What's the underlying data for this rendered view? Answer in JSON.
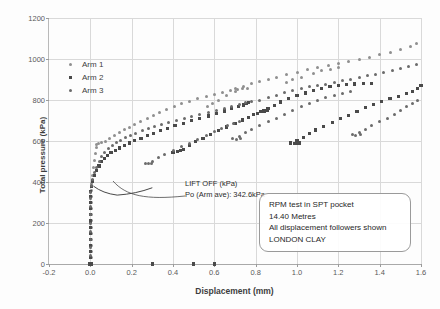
{
  "chart_data": {
    "type": "scatter",
    "title": "",
    "xlabel": "Displacement (mm)",
    "ylabel": "Total pressure (kPa)",
    "xlim": [
      -0.2,
      1.6
    ],
    "ylim": [
      0,
      1200
    ],
    "xticks": [
      "-0.2",
      "0.0",
      "0.2",
      "0.4",
      "0.6",
      "0.8",
      "1.0",
      "1.2",
      "1.4",
      "1.6"
    ],
    "yticks": [
      "0",
      "200",
      "400",
      "600",
      "800",
      "1000",
      "1200"
    ],
    "grid": true,
    "legend_position": "upper-left-inside",
    "legend": [
      "Arm 1",
      "Arm 2",
      "Arm 3"
    ],
    "colors": {
      "arm1": "#8f8f8f",
      "arm2": "#4a4a4a",
      "arm3": "#6b6b6b",
      "grid": "#d9d9d9",
      "axis": "#a9a9a9"
    },
    "annotations": [
      "LIFT OFF (kPa)",
      "Po (Arm ave): 342.6kPa",
      "RPM test in SPT pocket",
      "14.40 Metres",
      "All displacement followers shown",
      "LONDON CLAY"
    ],
    "series": [
      {
        "name": "Arm 1",
        "marker": "circle",
        "color": "#8f8f8f",
        "points": [
          [
            0.005,
            0
          ],
          [
            0.005,
            30
          ],
          [
            0.005,
            60
          ],
          [
            0.005,
            90
          ],
          [
            0.005,
            120
          ],
          [
            0.005,
            150
          ],
          [
            0.005,
            180
          ],
          [
            0.005,
            210
          ],
          [
            0.005,
            240
          ],
          [
            0.005,
            270
          ],
          [
            0.005,
            300
          ],
          [
            0.005,
            330
          ],
          [
            0.006,
            360
          ],
          [
            0.008,
            395
          ],
          [
            0.012,
            430
          ],
          [
            0.016,
            470
          ],
          [
            0.02,
            505
          ],
          [
            0.024,
            540
          ],
          [
            0.028,
            570
          ],
          [
            0.032,
            585
          ],
          [
            0.04,
            590
          ],
          [
            0.055,
            592
          ],
          [
            0.075,
            600
          ],
          [
            0.095,
            612
          ],
          [
            0.115,
            625
          ],
          [
            0.14,
            640
          ],
          [
            0.165,
            655
          ],
          [
            0.19,
            668
          ],
          [
            0.215,
            682
          ],
          [
            0.245,
            697
          ],
          [
            0.275,
            712
          ],
          [
            0.305,
            725
          ],
          [
            0.335,
            740
          ],
          [
            0.37,
            755
          ],
          [
            0.405,
            770
          ],
          [
            0.44,
            782
          ],
          [
            0.48,
            795
          ],
          [
            0.52,
            806
          ],
          [
            0.56,
            818
          ],
          [
            0.6,
            828
          ],
          [
            0.64,
            838
          ],
          [
            0.68,
            846
          ],
          [
            0.71,
            852
          ],
          [
            0.735,
            856
          ],
          [
            0.76,
            858
          ],
          [
            0.7,
            840
          ],
          [
            0.66,
            820
          ],
          [
            0.62,
            800
          ],
          [
            0.59,
            782
          ],
          [
            0.565,
            768
          ],
          [
            0.7,
            856
          ],
          [
            0.74,
            868
          ],
          [
            0.78,
            880
          ],
          [
            0.82,
            890
          ],
          [
            0.86,
            900
          ],
          [
            0.9,
            912
          ],
          [
            0.95,
            924
          ],
          [
            1.0,
            936
          ],
          [
            1.05,
            948
          ],
          [
            1.1,
            958
          ],
          [
            1.15,
            968
          ],
          [
            1.2,
            978
          ],
          [
            1.25,
            988
          ],
          [
            1.3,
            998
          ],
          [
            1.35,
            1008
          ],
          [
            1.4,
            1020
          ],
          [
            1.45,
            1032
          ],
          [
            1.5,
            1046
          ],
          [
            1.55,
            1062
          ],
          [
            1.58,
            1078
          ],
          [
            1.08,
            930
          ],
          [
            1.12,
            942
          ],
          [
            1.16,
            950
          ],
          [
            1.2,
            958
          ],
          [
            1.02,
            912
          ],
          [
            0.98,
            898
          ],
          [
            0.95,
            886
          ]
        ]
      },
      {
        "name": "Arm 2",
        "marker": "square",
        "color": "#4a4a4a",
        "points": [
          [
            0.0,
            0
          ],
          [
            0.0,
            30
          ],
          [
            0.0,
            60
          ],
          [
            0.0,
            90
          ],
          [
            0.0,
            120
          ],
          [
            0.0,
            150
          ],
          [
            0.0,
            180
          ],
          [
            0.0,
            210
          ],
          [
            0.0,
            240
          ],
          [
            0.0,
            270
          ],
          [
            0.0,
            300
          ],
          [
            0.0,
            330
          ],
          [
            0.002,
            355
          ],
          [
            0.006,
            380
          ],
          [
            0.012,
            405
          ],
          [
            0.02,
            430
          ],
          [
            0.03,
            455
          ],
          [
            0.042,
            478
          ],
          [
            0.055,
            498
          ],
          [
            0.07,
            516
          ],
          [
            0.085,
            530
          ],
          [
            0.1,
            542
          ],
          [
            0.12,
            554
          ],
          [
            0.14,
            566
          ],
          [
            0.165,
            578
          ],
          [
            0.19,
            590
          ],
          [
            0.215,
            602
          ],
          [
            0.245,
            614
          ],
          [
            0.275,
            626
          ],
          [
            0.305,
            638
          ],
          [
            0.34,
            650
          ],
          [
            0.375,
            662
          ],
          [
            0.41,
            674
          ],
          [
            0.45,
            686
          ],
          [
            0.49,
            698
          ],
          [
            0.53,
            710
          ],
          [
            0.57,
            722
          ],
          [
            0.61,
            734
          ],
          [
            0.65,
            746
          ],
          [
            0.685,
            758
          ],
          [
            0.715,
            768
          ],
          [
            0.74,
            776
          ],
          [
            0.755,
            782
          ],
          [
            0.765,
            786
          ],
          [
            0.45,
            560
          ],
          [
            0.48,
            578
          ],
          [
            0.51,
            596
          ],
          [
            0.545,
            614
          ],
          [
            0.58,
            632
          ],
          [
            0.62,
            650
          ],
          [
            0.66,
            668
          ],
          [
            0.7,
            686
          ],
          [
            0.735,
            702
          ],
          [
            0.765,
            716
          ],
          [
            0.79,
            728
          ],
          [
            0.81,
            736
          ],
          [
            0.825,
            742
          ],
          [
            0.84,
            746
          ],
          [
            0.855,
            748
          ],
          [
            0.4,
            545
          ],
          [
            0.42,
            548
          ],
          [
            0.435,
            552
          ],
          [
            0.86,
            760
          ],
          [
            0.89,
            775
          ],
          [
            0.92,
            790
          ],
          [
            0.96,
            806
          ],
          [
            1.0,
            820
          ],
          [
            1.04,
            834
          ],
          [
            1.08,
            846
          ],
          [
            1.12,
            856
          ],
          [
            1.16,
            864
          ],
          [
            1.2,
            870
          ],
          [
            1.24,
            874
          ],
          [
            1.28,
            878
          ],
          [
            1.32,
            880
          ],
          [
            1.36,
            882
          ],
          [
            1.0,
            600
          ],
          [
            1.03,
            618
          ],
          [
            1.06,
            636
          ],
          [
            1.09,
            654
          ],
          [
            1.13,
            672
          ],
          [
            1.17,
            690
          ],
          [
            1.21,
            708
          ],
          [
            1.25,
            726
          ],
          [
            1.29,
            744
          ],
          [
            1.33,
            762
          ],
          [
            1.37,
            778
          ],
          [
            1.41,
            792
          ],
          [
            1.45,
            806
          ],
          [
            1.49,
            818
          ],
          [
            1.53,
            830
          ],
          [
            1.56,
            842
          ],
          [
            1.585,
            855
          ],
          [
            1.6,
            870
          ],
          [
            0.97,
            590
          ],
          [
            0.99,
            588
          ],
          [
            1.01,
            590
          ]
        ]
      },
      {
        "name": "Arm 3",
        "marker": "circle",
        "color": "#6b6b6b",
        "points": [
          [
            0.0,
            0
          ],
          [
            0.0,
            40
          ],
          [
            0.0,
            80
          ],
          [
            0.0,
            120
          ],
          [
            0.0,
            160
          ],
          [
            0.0,
            200
          ],
          [
            0.0,
            240
          ],
          [
            0.0,
            280
          ],
          [
            0.0,
            320
          ],
          [
            0.002,
            350
          ],
          [
            0.006,
            382
          ],
          [
            0.012,
            412
          ],
          [
            0.02,
            444
          ],
          [
            0.03,
            472
          ],
          [
            0.042,
            498
          ],
          [
            0.056,
            522
          ],
          [
            0.07,
            544
          ],
          [
            0.088,
            562
          ],
          [
            0.106,
            578
          ],
          [
            0.126,
            592
          ],
          [
            0.148,
            604
          ],
          [
            0.17,
            616
          ],
          [
            0.195,
            628
          ],
          [
            0.22,
            638
          ],
          [
            0.25,
            650
          ],
          [
            0.28,
            660
          ],
          [
            0.31,
            670
          ],
          [
            0.345,
            680
          ],
          [
            0.38,
            690
          ],
          [
            0.415,
            700
          ],
          [
            0.455,
            710
          ],
          [
            0.49,
            720
          ],
          [
            0.53,
            730
          ],
          [
            0.57,
            740
          ],
          [
            0.61,
            750
          ],
          [
            0.65,
            760
          ],
          [
            0.685,
            770
          ],
          [
            0.72,
            778
          ],
          [
            0.75,
            786
          ],
          [
            0.78,
            792
          ],
          [
            0.82,
            800
          ],
          [
            0.86,
            812
          ],
          [
            0.9,
            824
          ],
          [
            0.94,
            836
          ],
          [
            0.98,
            846
          ],
          [
            1.02,
            856
          ],
          [
            1.06,
            864
          ],
          [
            1.1,
            872
          ],
          [
            1.14,
            878
          ],
          [
            1.18,
            886
          ],
          [
            1.22,
            894
          ],
          [
            1.26,
            902
          ],
          [
            1.3,
            910
          ],
          [
            1.34,
            918
          ],
          [
            1.38,
            926
          ],
          [
            1.42,
            934
          ],
          [
            1.46,
            942
          ],
          [
            1.5,
            952
          ],
          [
            1.54,
            962
          ],
          [
            1.58,
            974
          ],
          [
            1.3,
            640
          ],
          [
            1.33,
            658
          ],
          [
            1.36,
            676
          ],
          [
            1.4,
            694
          ],
          [
            1.44,
            712
          ],
          [
            1.47,
            730
          ],
          [
            1.5,
            748
          ],
          [
            1.53,
            766
          ],
          [
            1.56,
            784
          ],
          [
            1.585,
            800
          ],
          [
            1.27,
            632
          ],
          [
            1.285,
            628
          ],
          [
            1.305,
            630
          ],
          [
            0.72,
            622
          ],
          [
            0.75,
            640
          ],
          [
            0.78,
            658
          ],
          [
            0.82,
            676
          ],
          [
            0.86,
            694
          ],
          [
            0.9,
            712
          ],
          [
            0.94,
            730
          ],
          [
            0.98,
            748
          ],
          [
            1.02,
            766
          ],
          [
            1.06,
            782
          ],
          [
            1.1,
            796
          ],
          [
            1.14,
            810
          ],
          [
            1.18,
            822
          ],
          [
            1.22,
            832
          ],
          [
            1.26,
            840
          ],
          [
            0.69,
            612
          ],
          [
            0.705,
            608
          ],
          [
            0.725,
            612
          ],
          [
            0.3,
            500
          ],
          [
            0.33,
            518
          ],
          [
            0.36,
            536
          ],
          [
            0.4,
            554
          ],
          [
            0.44,
            572
          ],
          [
            0.48,
            590
          ],
          [
            0.52,
            608
          ],
          [
            0.56,
            626
          ],
          [
            0.6,
            644
          ],
          [
            0.635,
            660
          ],
          [
            0.665,
            674
          ],
          [
            0.695,
            686
          ],
          [
            0.72,
            696
          ],
          [
            0.265,
            492
          ],
          [
            0.28,
            488
          ],
          [
            0.295,
            492
          ]
        ]
      }
    ],
    "zero_row_markers": [
      [
        -0.005,
        0
      ],
      [
        0.0,
        0
      ],
      [
        0.005,
        0
      ],
      [
        0.3,
        0
      ],
      [
        0.5,
        0
      ],
      [
        0.6,
        0
      ]
    ],
    "liftoff_curve": "descends from ~(0.02,378) to minimum ~(0.13,338) then rises to ~(0.30,372)"
  },
  "axis": {
    "x_title": "Displacement (mm)",
    "y_title": "Total pressure (kPa)"
  },
  "legend": {
    "items": [
      {
        "label": "Arm 1",
        "marker": "circle"
      },
      {
        "label": "Arm 2",
        "marker": "square"
      },
      {
        "label": "Arm 3",
        "marker": "circle-small"
      }
    ]
  },
  "callout": {
    "line1": "LIFT OFF (kPa)",
    "line2": "Po (Arm ave): 342.6kPa"
  },
  "note_box": {
    "line1": "RPM test in SPT pocket",
    "line2": "14.40 Metres",
    "line3": "All displacement followers shown",
    "line4": "LONDON CLAY"
  }
}
